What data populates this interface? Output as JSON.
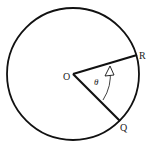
{
  "diagram": {
    "labels": {
      "center": "O",
      "point_r": "R",
      "point_q": "Q",
      "angle": "θ"
    },
    "colors": {
      "stroke": "#111111",
      "background": "#ffffff"
    }
  }
}
